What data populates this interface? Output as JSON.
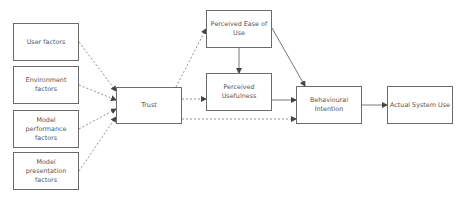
{
  "diagram": {
    "nodes": [
      {
        "id": "user",
        "label": "User factors",
        "x": 13,
        "y": 23,
        "w": 66,
        "h": 38
      },
      {
        "id": "env",
        "label": "Environment factors",
        "x": 13,
        "y": 66,
        "w": 66,
        "h": 38
      },
      {
        "id": "perf",
        "label": "Model performance factors",
        "x": 13,
        "y": 110,
        "w": 66,
        "h": 38
      },
      {
        "id": "pres",
        "label": "Model presentation factors",
        "x": 13,
        "y": 152,
        "w": 66,
        "h": 38
      },
      {
        "id": "trust",
        "label": "Trust",
        "x": 116,
        "y": 87,
        "w": 66,
        "h": 37
      },
      {
        "id": "peou",
        "label": "Perceived Ease of Use",
        "x": 206,
        "y": 10,
        "w": 66,
        "h": 38
      },
      {
        "id": "pu",
        "label": "Perceived Usefulness",
        "x": 206,
        "y": 73,
        "w": 66,
        "h": 38
      },
      {
        "id": "bi",
        "label": "Behavioural Intention",
        "x": 296,
        "y": 86,
        "w": 66,
        "h": 38
      },
      {
        "id": "asu",
        "label": "Actual System Use",
        "x": 387,
        "y": 86,
        "w": 66,
        "h": 38
      }
    ],
    "edges": [
      {
        "from": "user",
        "to": "trust",
        "style": "dashed"
      },
      {
        "from": "env",
        "to": "trust",
        "style": "dashed"
      },
      {
        "from": "perf",
        "to": "trust",
        "style": "dashed"
      },
      {
        "from": "pres",
        "to": "trust",
        "style": "dashed"
      },
      {
        "from": "trust",
        "to": "peou",
        "style": "dashed"
      },
      {
        "from": "trust",
        "to": "pu",
        "style": "dashed"
      },
      {
        "from": "trust",
        "to": "bi",
        "style": "dashed"
      },
      {
        "from": "peou",
        "to": "pu",
        "style": "solid"
      },
      {
        "from": "peou",
        "to": "bi",
        "style": "solid"
      },
      {
        "from": "pu",
        "to": "bi",
        "style": "solid"
      },
      {
        "from": "bi",
        "to": "asu",
        "style": "solid"
      }
    ],
    "colors": {
      "stroke": "#6b6b6b",
      "text": "#555555",
      "background": "#ffffff"
    }
  }
}
